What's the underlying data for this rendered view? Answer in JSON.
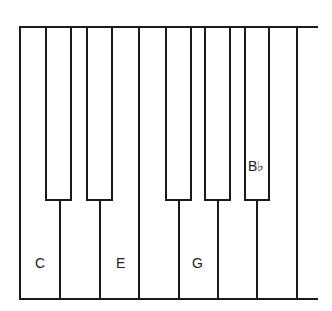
{
  "diagram": {
    "type": "piano-keyboard",
    "white_keys": [
      "C",
      "D",
      "E",
      "F",
      "G",
      "A",
      "B"
    ],
    "black_keys": [
      "C#",
      "D#",
      "F#",
      "G#",
      "Bb"
    ],
    "labels": {
      "c": "C",
      "e": "E",
      "g": "G",
      "bflat": "B♭"
    },
    "colors": {
      "outline": "#1a1a1a",
      "background": "#ffffff"
    }
  }
}
